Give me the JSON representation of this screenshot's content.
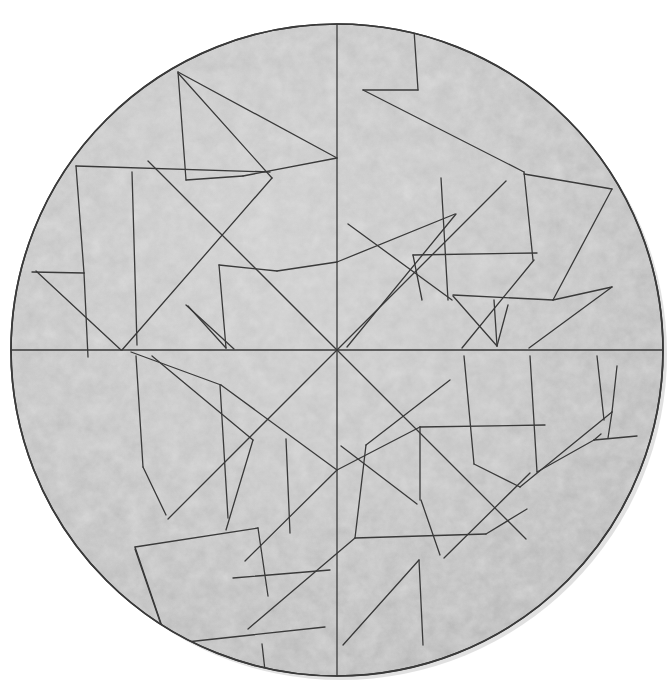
{
  "figure": {
    "kind": "geometric-dissection-diagram",
    "background_color": "#ffffff",
    "canvas": {
      "width": 671,
      "height": 698
    }
  },
  "circle": {
    "center_x": 337,
    "center_y": 350,
    "radius": 326,
    "left_edge_x": 18,
    "right_edge_x": 655,
    "top_edge_y": 24,
    "bottom_edge_y": 677,
    "fill_color": "#bdbdbd",
    "fill_highlight_color": "#cfcfcf",
    "fill_shadow_color": "#a8a8a8",
    "outline_color": "#3a3a3a",
    "outline_width": 1.6,
    "texture": "mottled grainy speckle"
  },
  "cut_lines": {
    "stroke_color": "#3a3a3a",
    "stroke_width": 1.3,
    "count": 60,
    "hub": {
      "x": 337,
      "y": 350,
      "radiating_line_count": 6,
      "directions": [
        "up",
        "down",
        "left",
        "right",
        "up-left diagonal",
        "down-right diagonal",
        "up-right diagonal",
        "down-left diagonal"
      ]
    },
    "symmetry": "two-fold (180 degree) rotational symmetry about the centre"
  },
  "caption": {
    "text": "Fig. 1  A circle cut into straight-sided pieces",
    "visible": "clipped at the bottom edge of the image; only the top pixel row of the glyphs is rendered",
    "color": "#b9b9b9"
  }
}
